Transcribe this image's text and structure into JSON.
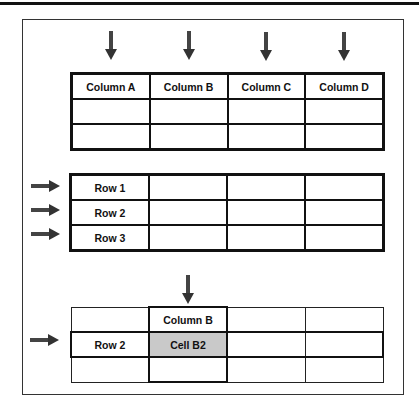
{
  "diagram": {
    "section1": {
      "title": "Columns",
      "columns": [
        "Column A",
        "Column B",
        "Column C",
        "Column D"
      ],
      "empty_rows": 2,
      "arrows": [
        "down-arrow-column-a",
        "down-arrow-column-b",
        "down-arrow-column-c",
        "down-arrow-column-d"
      ]
    },
    "section2": {
      "title": "Rows",
      "rows": [
        "Row 1",
        "Row 2",
        "Row 3"
      ],
      "empty_columns": 3
    },
    "section3": {
      "title": "Cell",
      "column_label": "Column B",
      "row_label": "Row 2",
      "cell_label": "Cell B2",
      "highlight_color": "#c9c9c9"
    },
    "colors": {
      "arrow": "#444444",
      "border": "#111111",
      "frame": "#333333"
    }
  }
}
